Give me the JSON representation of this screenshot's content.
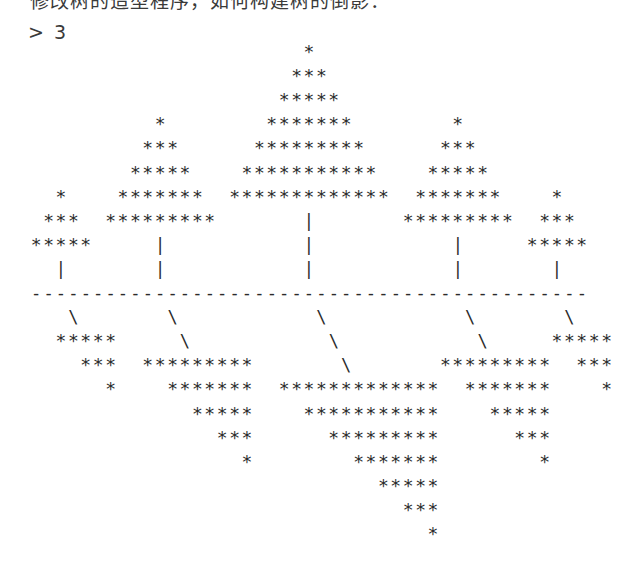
{
  "heading": "修改树的造型程序，如何构建树的倒影：",
  "prompt": {
    "symbol": ">",
    "input": "3"
  },
  "art": {
    "char_width": 12.4,
    "line_height": 24.1,
    "colors": {
      "text": "#2b2b2b",
      "background": "#ffffff"
    },
    "trees": [
      {
        "name": "tree-1",
        "center_col": 2,
        "tiers": 3,
        "trunk": 1
      },
      {
        "name": "tree-2",
        "center_col": 10,
        "tiers": 5,
        "trunk": 2
      },
      {
        "name": "tree-3",
        "center_col": 22,
        "tiers": 7,
        "trunk": 3
      },
      {
        "name": "tree-4",
        "center_col": 34,
        "tiers": 5,
        "trunk": 2
      },
      {
        "name": "tree-5",
        "center_col": 42,
        "tiers": 3,
        "trunk": 1
      }
    ],
    "ground_width": 45,
    "glyphs": {
      "leaf": "*",
      "trunk": "|",
      "shadow_trunk": "\\",
      "ground": "-"
    }
  }
}
